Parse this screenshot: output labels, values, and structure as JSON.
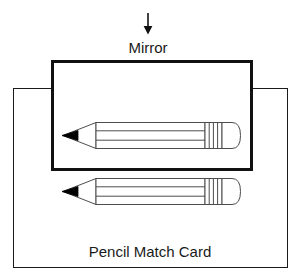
{
  "figure": {
    "title_label": "Pencil Match Card",
    "mirror_label": "Mirror",
    "colors": {
      "background": "#ffffff",
      "card_stroke": "#1a1a1a",
      "mirror_stroke": "#111111",
      "pencil_stroke": "#4d4d4d",
      "pencil_tip_fill": "#000000",
      "text": "#1a1a1a"
    },
    "card": {
      "name": "Pencil Match Card",
      "x": 13,
      "y": 88,
      "width": 275,
      "height": 180,
      "border_width": 1
    },
    "mirror": {
      "name": "Mirror",
      "x": 51,
      "y": 60,
      "width": 202,
      "height": 111,
      "border_width": 3
    },
    "pointer_arrow": {
      "name": "arrow pointing down at mirror",
      "x": 148,
      "y_start": 13,
      "y_end": 34,
      "direction": "down"
    },
    "pencils": [
      {
        "name": "pencil inside mirror",
        "location": "inside-mirror",
        "tip_direction": "left",
        "x": 62,
        "y": 122,
        "length": 155,
        "height": 27,
        "facet_lines": 2,
        "ferrule_stripes": 3
      },
      {
        "name": "pencil on card below mirror",
        "location": "on-card-below-mirror",
        "tip_direction": "left",
        "x": 62,
        "y": 178,
        "length": 155,
        "height": 27,
        "facet_lines": 2,
        "ferrule_stripes": 3
      }
    ],
    "labels": {
      "mirror_text_x": 148,
      "mirror_text_y": 53,
      "card_text_x": 150,
      "card_text_y": 257
    }
  }
}
